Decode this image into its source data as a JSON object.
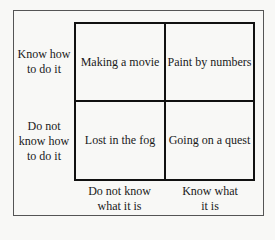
{
  "diagram": {
    "type": "2x2 matrix",
    "row_labels": [
      "Know how to do it",
      "Do not know how to do it"
    ],
    "column_labels": [
      "Do not know what it is",
      "Know what it is"
    ],
    "cells": {
      "top_left": "Making a movie",
      "top_right": "Paint by numbers",
      "bottom_left": "Lost in the fog",
      "bottom_right": "Going on a quest"
    },
    "row_label_lines": {
      "row1": [
        "Know how",
        "to do it"
      ],
      "row2": [
        "Do not",
        "know how",
        "to do it"
      ]
    },
    "column_label_lines": {
      "col1": [
        "Do not know",
        "what it is"
      ],
      "col2": [
        "Know what",
        "it is"
      ]
    }
  }
}
